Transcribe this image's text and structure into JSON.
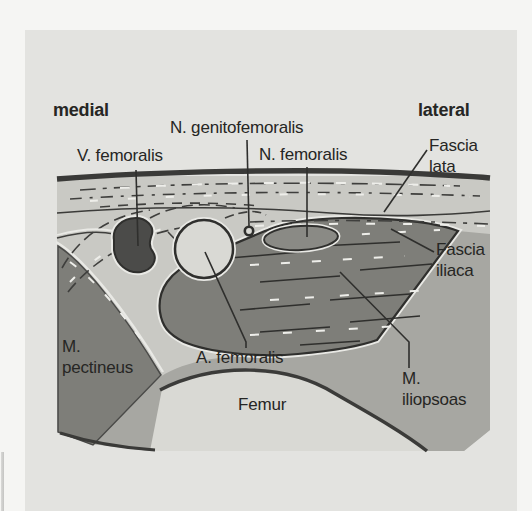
{
  "figure": {
    "orientation": {
      "medial": "medial",
      "lateral": "lateral"
    },
    "labels": {
      "n_genitofemoralis": "N. genitofemoralis",
      "v_femoralis": "V. femoralis",
      "n_femoralis": "N. femoralis",
      "fascia_lata": "Fascia\nlata",
      "fascia_iliaca": "Fascia\niliaca",
      "m_pectineus": "M.\npectineus",
      "a_femoralis": "A. femoralis",
      "femur": "Femur",
      "m_iliopsoas": "M.\niliopsoas"
    },
    "colors": {
      "page_background": "#f5f5f3",
      "panel_background": "#e3e3e0",
      "tissue": "#c9c9c4",
      "intermediate_tissue": "#a7a7a2",
      "muscle": "#7e7e79",
      "bone": "#d9d9d4",
      "vein_fill": "#4b4b49",
      "artery_fill": "#d9d9d4",
      "nerve_fill": "#8a8a85",
      "outline": "#2f2f2d",
      "halo": "#e9e9e5",
      "text": "#262624"
    }
  }
}
